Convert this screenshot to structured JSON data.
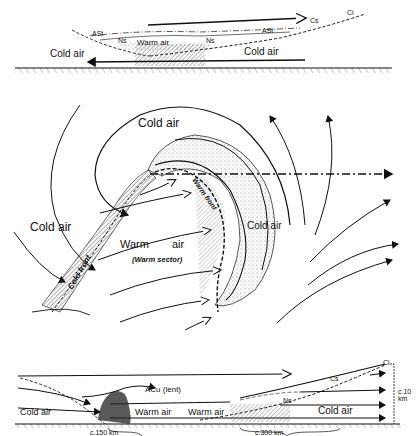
{
  "top_section": {
    "title": "Vertical cross-section through warm and cold fronts (upper)",
    "labels": {
      "cold_air_left": "Cold air",
      "cold_air_right": "Cold air",
      "warm_air": "Warm air",
      "cloud_cs": "Cs",
      "cloud_ci": "Ci",
      "cloud_astr_left": "ASt",
      "cloud_astr_right": "ASt",
      "cloud_ns_left": "Ns",
      "cloud_ns_right": "Ns",
      "cloud_cs_str": "CSt"
    }
  },
  "middle_section": {
    "title": "Plan view of frontal depression",
    "labels": {
      "cold_air_top": "Cold air",
      "cold_air_left": "Cold air",
      "cold_air_right": "Cold air",
      "warm_air_1": "Warm",
      "warm_air_2": "air",
      "warm_sector": "(Warm sector)",
      "cold_front": "Cold front",
      "warm_front": "Warm front"
    }
  },
  "bottom_section": {
    "title": "Vertical cross-section through warm and cold fronts (lower)",
    "labels": {
      "cold_air_left": "Cold air",
      "warm_air_1": "Warm air",
      "warm_air_2": "Warm air",
      "cold_air_right": "Cold air",
      "acu_lent": "ACu (lent)",
      "cloud_ci": "Ci",
      "cloud_cs": "Cs",
      "cloud_ns": "Ns",
      "height_label_1": "c.10",
      "height_label_2": "km",
      "scale_left": "c.150 km",
      "scale_right": "c.300 km"
    }
  }
}
